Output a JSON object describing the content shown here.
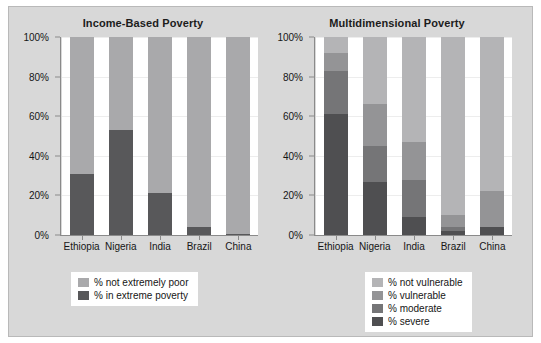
{
  "figure": {
    "background_color": "#d8d8d8",
    "plot_background_color": "#ffffff"
  },
  "chart_data": [
    {
      "type": "bar",
      "stacked": true,
      "title": "Income-Based Poverty",
      "xlabel": "",
      "ylabel": "",
      "ylim": [
        0,
        100
      ],
      "grid": true,
      "legend_position": "bottom",
      "categories": [
        "Ethiopia",
        "Nigeria",
        "India",
        "Brazil",
        "China"
      ],
      "tick_labels": [
        "0%",
        "20%",
        "40%",
        "60%",
        "80%",
        "100%"
      ],
      "tick_values": [
        0,
        20,
        40,
        60,
        80,
        100
      ],
      "series": [
        {
          "name": "% in extreme poverty",
          "color": "#58585a",
          "values": [
            31,
            53,
            21,
            4,
            0.7
          ]
        },
        {
          "name": "% not extremely poor",
          "color": "#a9a9ab",
          "values": [
            69,
            47,
            79,
            96,
            99.3
          ]
        }
      ]
    },
    {
      "type": "bar",
      "stacked": true,
      "title": "Multidimensional Poverty",
      "xlabel": "",
      "ylabel": "",
      "ylim": [
        0,
        100
      ],
      "grid": true,
      "legend_position": "bottom",
      "categories": [
        "Ethiopia",
        "Nigeria",
        "India",
        "Brazil",
        "China"
      ],
      "tick_labels": [
        "0%",
        "20%",
        "40%",
        "60%",
        "80%",
        "100%"
      ],
      "tick_values": [
        0,
        20,
        40,
        60,
        80,
        100
      ],
      "series": [
        {
          "name": "% severe",
          "color": "#4f4f51",
          "values": [
            61,
            27,
            9,
            2,
            4
          ]
        },
        {
          "name": "% moderate",
          "color": "#757577",
          "values": [
            22,
            18,
            19,
            2,
            0
          ]
        },
        {
          "name": "% vulnerable",
          "color": "#949496",
          "values": [
            9,
            21,
            19,
            6,
            18
          ]
        },
        {
          "name": "% not vulnerable",
          "color": "#b4b4b6",
          "values": [
            8,
            34,
            53,
            90,
            78
          ]
        }
      ]
    }
  ],
  "legends": {
    "left": {
      "items": [
        {
          "label": "% not extremely poor",
          "color": "#a9a9ab"
        },
        {
          "label": "% in extreme poverty",
          "color": "#58585a"
        }
      ]
    },
    "right": {
      "items": [
        {
          "label": "% not vulnerable",
          "color": "#b4b4b6"
        },
        {
          "label": "% vulnerable",
          "color": "#949496"
        },
        {
          "label": "% moderate",
          "color": "#757577"
        },
        {
          "label": "% severe",
          "color": "#4f4f51"
        }
      ]
    }
  }
}
